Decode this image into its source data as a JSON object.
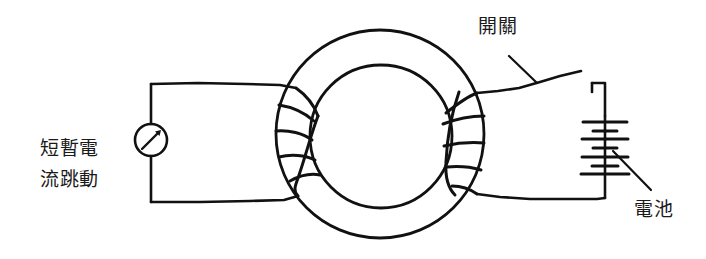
{
  "figure": {
    "background_color": "#ffffff",
    "ink_color": "#111111"
  },
  "labels": {
    "left_annotation": {
      "line1": "短暫電",
      "line2": "流跳動"
    },
    "switch": "開關",
    "battery": "電池"
  },
  "components": {
    "meter": {
      "name": "galvanometer",
      "symbol": "circle-with-diagonal-needle"
    },
    "core": {
      "name": "iron-ring-core",
      "shape": "annulus"
    },
    "primary_coil": {
      "name": "right-coil",
      "turns": 4
    },
    "secondary_coil": {
      "name": "left-coil",
      "turns": 4
    },
    "switch": {
      "name": "knife-switch",
      "state": "open"
    },
    "battery": {
      "name": "battery-stack",
      "cells": 3
    }
  }
}
